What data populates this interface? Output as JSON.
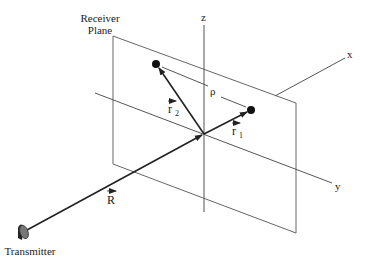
{
  "diagram": {
    "type": "3d-coordinate-geometry",
    "labels": {
      "receiver_plane_line1": "Receiver",
      "receiver_plane_line2": "Plane",
      "z_axis": "z",
      "x_axis": "x",
      "y_axis": "y",
      "rho": "ρ",
      "r2_vector": "r",
      "r2_subscript": "2",
      "r1_vector": "r",
      "r1_subscript": "1",
      "R_vector": "R",
      "transmitter": "Transmitter"
    },
    "colors": {
      "axis_line": "#555555",
      "vector_line": "#222222",
      "plane_edge": "#666666",
      "point_fill": "#111111",
      "dish_fill": "#777777"
    }
  }
}
